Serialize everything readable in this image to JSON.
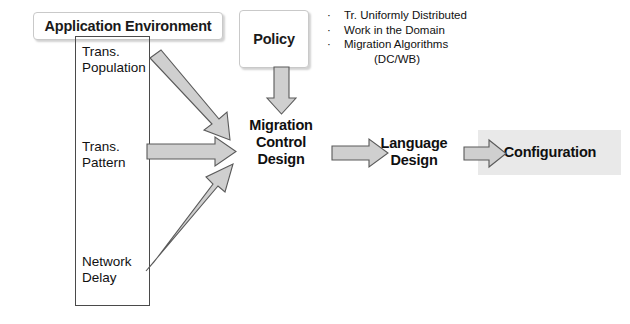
{
  "diagram": {
    "title_boxes": {
      "application_environment": "Application Environment",
      "policy": "Policy"
    },
    "factors": [
      {
        "name": "trans-population",
        "line1": "Trans.",
        "line2": "Population"
      },
      {
        "name": "trans-pattern",
        "line1": "Trans.",
        "line2": "Pattern"
      },
      {
        "name": "network-delay",
        "line1": "Network",
        "line2": "Delay"
      }
    ],
    "stages": {
      "migration_control_design": "Migration\nControl\nDesign",
      "migration_line1": "Migration",
      "migration_line2": "Control",
      "migration_line3": "Design",
      "language_design_line1": "Language",
      "language_design_line2": "Design",
      "configuration": "Configuration"
    },
    "notes": {
      "bullets": [
        "Tr. Uniformly Distributed",
        "Work in the Domain",
        "Migration Algorithms"
      ],
      "sub_note": "(DC/WB)",
      "bullet_marker": "·"
    },
    "colors": {
      "arrow_fill": "#cfcfcf",
      "arrow_stroke": "#5a5a5a",
      "config_panel": "#e9e9e9",
      "box_border": "#c9c9c9",
      "container_border": "#4a4a4a",
      "text": "#111111",
      "background": "#ffffff"
    },
    "arrows": [
      {
        "name": "policy-to-migration",
        "direction": "down"
      },
      {
        "name": "trans-population-to-migration",
        "direction": "diagonal-down-right"
      },
      {
        "name": "trans-pattern-to-migration",
        "direction": "right"
      },
      {
        "name": "network-delay-to-migration",
        "direction": "diagonal-up-right"
      },
      {
        "name": "migration-to-language",
        "direction": "right"
      },
      {
        "name": "language-to-configuration",
        "direction": "right"
      }
    ]
  }
}
